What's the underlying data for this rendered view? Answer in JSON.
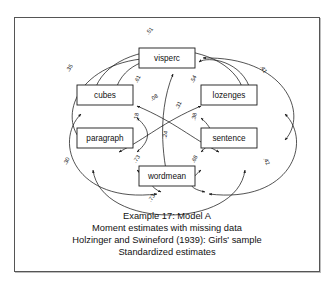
{
  "figure": {
    "frame": {
      "border_color": "#555555",
      "background": "#ffffff"
    },
    "chart_data": {
      "type": "diagram",
      "title": "Example 17: Model A",
      "subtitle": "Moment estimates with missing data",
      "source": "Holzinger and Swineford (1939): Girls' sample",
      "note": "Standardized estimates",
      "nodes": [
        {
          "id": "visperc",
          "label": "visperc",
          "x": 168,
          "y": 62,
          "w": 56,
          "h": 20
        },
        {
          "id": "cubes",
          "label": "cubes",
          "x": 106,
          "y": 99,
          "w": 56,
          "h": 20
        },
        {
          "id": "lozenges",
          "label": "lozenges",
          "x": 230,
          "y": 99,
          "w": 56,
          "h": 20
        },
        {
          "id": "paragraph",
          "label": "paragraph",
          "x": 106,
          "y": 142,
          "w": 56,
          "h": 20
        },
        {
          "id": "sentence",
          "label": "sentence",
          "x": 230,
          "y": 142,
          "w": 56,
          "h": 20
        },
        {
          "id": "wordmean",
          "label": "wordmean",
          "x": 168,
          "y": 180,
          "w": 56,
          "h": 20
        }
      ],
      "edges": [
        {
          "from": "cubes",
          "to": "lozenges",
          "label": ".51",
          "label_x": 152,
          "label_y": 36,
          "rotate": -52
        },
        {
          "from": "cubes",
          "to": "visperc",
          "label": ".61",
          "label_x": 140,
          "label_y": 84,
          "rotate": -62
        },
        {
          "from": "visperc",
          "to": "lozenges",
          "label": ".54",
          "label_x": 196,
          "label_y": 84,
          "rotate": -62
        },
        {
          "from": "cubes",
          "to": "paragraph",
          "label": ".35",
          "label_x": 72,
          "label_y": 73,
          "rotate": -60
        },
        {
          "from": "lozenges",
          "to": "sentence",
          "label": ".41",
          "label_x": 263,
          "label_y": 74,
          "rotate": 60
        },
        {
          "from": "paragraph",
          "to": "wordmean",
          "label": ".30",
          "label_x": 69,
          "label_y": 166,
          "rotate": -62
        },
        {
          "from": "sentence",
          "to": "wordmean",
          "label": ".42",
          "label_x": 266,
          "label_y": 166,
          "rotate": 62
        },
        {
          "from": "paragraph",
          "to": "sentence",
          "label": ".73",
          "label_x": 154,
          "label_y": 203,
          "rotate": -55
        },
        {
          "from": "cubes",
          "to": "paragraph",
          "label": ".18",
          "label_x": 139,
          "label_y": 121,
          "rotate": -80
        },
        {
          "from": "lozenges",
          "to": "sentence",
          "label": ".38",
          "label_x": 197,
          "label_y": 121,
          "rotate": -80
        },
        {
          "from": "cubes",
          "to": "sentence",
          "label": ".08",
          "label_x": 156,
          "label_y": 103,
          "rotate": -30
        },
        {
          "from": "lozenges",
          "to": "paragraph",
          "label": ".31",
          "label_x": 181,
          "label_y": 110,
          "rotate": -62
        },
        {
          "from": "paragraph",
          "to": "wordmean",
          "label": ".73",
          "label_x": 139,
          "label_y": 164,
          "rotate": -55
        },
        {
          "from": "sentence",
          "to": "wordmean",
          "label": ".68",
          "label_x": 197,
          "label_y": 164,
          "rotate": -62
        },
        {
          "from": "visperc",
          "to": "wordmean",
          "label": ".24",
          "label_x": 168,
          "label_y": 139,
          "rotate": -80
        }
      ]
    }
  }
}
